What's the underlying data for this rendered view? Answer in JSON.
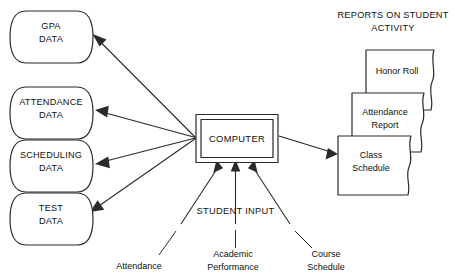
{
  "diagram": {
    "background_color": "#ffffff",
    "line_color": "#2a2a2a",
    "text_color": "#111111",
    "data_stores": [
      {
        "id": "gpa",
        "line1": "GPA",
        "line2": "DATA"
      },
      {
        "id": "attendance",
        "line1": "ATTENDANCE",
        "line2": "DATA"
      },
      {
        "id": "scheduling",
        "line1": "SCHEDULING",
        "line2": "DATA"
      },
      {
        "id": "test",
        "line1": "TEST",
        "line2": "DATA"
      }
    ],
    "processor": {
      "label": "COMPUTER"
    },
    "reports": {
      "heading_line1": "REPORTS ON STUDENT",
      "heading_line2": "ACTIVITY",
      "documents": [
        {
          "id": "honor-roll",
          "line1": "Honor Roll",
          "line2": ""
        },
        {
          "id": "attendance-report",
          "line1": "Attendance",
          "line2": "Report"
        },
        {
          "id": "class-schedule",
          "line1": "Class",
          "line2": "Schedule"
        }
      ]
    },
    "inputs": {
      "title": "STUDENT INPUT",
      "items": [
        {
          "id": "attendance-input",
          "line1": "Attendance",
          "line2": ""
        },
        {
          "id": "academic-performance-input",
          "line1": "Academic",
          "line2": "Performance"
        },
        {
          "id": "course-schedule-input",
          "line1": "Course",
          "line2": "Schedule"
        }
      ]
    }
  }
}
